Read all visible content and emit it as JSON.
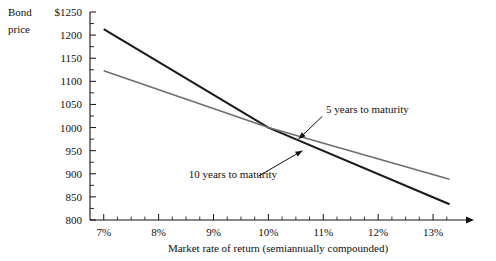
{
  "chart_data": {
    "type": "line",
    "title": "",
    "xlabel": "Market rate of return (semiannually compounded)",
    "ylabel_line1": "Bond",
    "ylabel_line2": "price",
    "x": [
      7,
      13.3
    ],
    "xlim": [
      6.75,
      13.6
    ],
    "ylim": [
      800,
      1250
    ],
    "xticks": [
      "7%",
      "8%",
      "9%",
      "10%",
      "11%",
      "12%",
      "13%"
    ],
    "xtick_values": [
      7,
      8,
      9,
      10,
      11,
      12,
      13
    ],
    "xminor_step": 0.25,
    "yticks": [
      "$1250",
      "1200",
      "1150",
      "1100",
      "1050",
      "1000",
      "950",
      "900",
      "850",
      "800"
    ],
    "ytick_values": [
      1250,
      1200,
      1150,
      1100,
      1050,
      1000,
      950,
      900,
      850,
      800
    ],
    "yminor_step": 25,
    "grid": false,
    "legend_position": "inline-annotations",
    "series": [
      {
        "name": "10 years to maturity",
        "color": "#1a1a1a",
        "width": 2.0,
        "points": [
          {
            "x": 7,
            "y": 1213
          },
          {
            "x": 10,
            "y": 1000
          },
          {
            "x": 13.3,
            "y": 834
          }
        ]
      },
      {
        "name": "5 years to maturity",
        "color": "#6e6e6e",
        "width": 1.6,
        "points": [
          {
            "x": 7,
            "y": 1123
          },
          {
            "x": 10,
            "y": 1000
          },
          {
            "x": 13.3,
            "y": 888
          }
        ]
      }
    ],
    "annotations": [
      {
        "label": "5 years to maturity",
        "text_x": 11.05,
        "text_y": 1032,
        "arrow_from_x": 10.98,
        "arrow_from_y": 1024,
        "arrow_to_x": 10.55,
        "arrow_to_y": 975
      },
      {
        "label": "10 years to maturity",
        "text_x": 8.55,
        "text_y": 890,
        "arrow_from_x": 9.82,
        "arrow_from_y": 895,
        "arrow_to_x": 10.62,
        "arrow_to_y": 950
      }
    ]
  }
}
